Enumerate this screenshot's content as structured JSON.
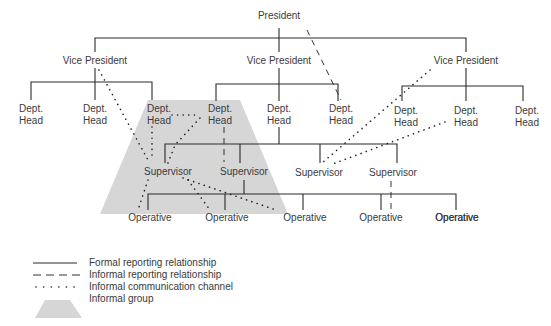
{
  "nodes": {
    "president": "President",
    "vp_left": "Vice President",
    "vp_center": "Vice President",
    "vp_right": "Vice President",
    "dept_head_1": [
      "Dept.",
      "Head"
    ],
    "dept_head_2": [
      "Dept.",
      "Head"
    ],
    "dept_head_3": [
      "Dept.",
      "Head"
    ],
    "dept_head_4": [
      "Dept.",
      "Head"
    ],
    "dept_head_5": [
      "Dept.",
      "Head"
    ],
    "dept_head_6": [
      "Dept.",
      "Head"
    ],
    "dept_head_7": [
      "Dept.",
      "Head"
    ],
    "dept_head_8": [
      "Dept.",
      "Head"
    ],
    "dept_head_9": [
      "Dept.",
      "Head"
    ],
    "supervisor_1": "Supervisor",
    "supervisor_2": "Supervisor",
    "supervisor_3": "Supervisor",
    "supervisor_4": "Supervisor",
    "operative_1": "Operative",
    "operative_2": "Operative",
    "operative_3": "Operative",
    "operative_4": "Operative",
    "operative_5": "Operative",
    "operative_6": "Operative"
  },
  "legend": [
    {
      "style": "formal",
      "label": "Formal reporting relationship"
    },
    {
      "style": "dashed",
      "label": "Informal reporting relationship"
    },
    {
      "style": "dotted",
      "label": "Informal communication channel"
    },
    {
      "style": "group",
      "label": "Informal group"
    }
  ],
  "colors": {
    "line": "#2a2a2a",
    "text": "#3a3a3a",
    "informal_group_fill": "#d6d6d6"
  }
}
